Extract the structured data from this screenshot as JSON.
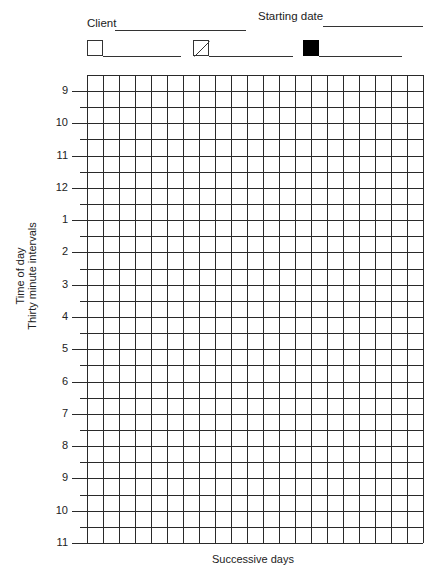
{
  "header": {
    "client_label": "Client",
    "client_value": "",
    "starting_date_label": "Starting date",
    "starting_date_value": ""
  },
  "legend": [
    {
      "symbol": "empty-square",
      "label": ""
    },
    {
      "symbol": "diagonal-square",
      "label": ""
    },
    {
      "symbol": "filled-square",
      "label": ""
    }
  ],
  "grid": {
    "columns": 21,
    "rows_half_hour": 29,
    "line_color": "#2a2a2a"
  },
  "y_axis": {
    "title_line1": "Time of day",
    "title_line2": "Thirty minute intervals",
    "tick_labels": [
      "9",
      "10",
      "11",
      "12",
      "1",
      "2",
      "3",
      "4",
      "5",
      "6",
      "7",
      "8",
      "9",
      "10",
      "11"
    ]
  },
  "x_axis": {
    "title": "Successive days"
  },
  "colors": {
    "ink": "#1a1a1a",
    "background": "#ffffff",
    "filled_box": "#000000"
  }
}
